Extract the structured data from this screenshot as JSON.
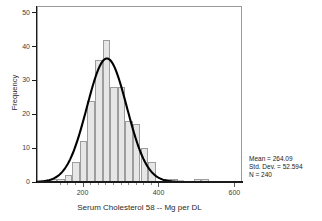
{
  "chart_data": {
    "type": "bar",
    "title": "",
    "subtitle": "",
    "xlabel": "Serum Cholesterol 58 -- Mg per DL",
    "ylabel": "Frequency",
    "xlim": [
      80,
      620
    ],
    "ylim": [
      0,
      52
    ],
    "grid": false,
    "legend_position": "none",
    "x_ticks": [
      200,
      400,
      600
    ],
    "y_ticks": [
      0,
      10,
      20,
      30,
      40,
      50
    ],
    "bin_width": 20,
    "bin_starts": [
      110,
      130,
      150,
      170,
      190,
      210,
      230,
      250,
      270,
      290,
      310,
      330,
      350,
      370,
      410,
      430,
      490,
      510
    ],
    "bin_centers": [
      120,
      140,
      160,
      180,
      200,
      220,
      240,
      260,
      280,
      300,
      320,
      340,
      360,
      380,
      420,
      440,
      500,
      520
    ],
    "values": [
      1,
      1,
      2,
      6,
      12,
      24,
      36,
      42,
      28,
      28,
      18,
      17,
      10,
      6,
      1,
      1,
      1,
      1
    ],
    "overlay": {
      "type": "normal-curve",
      "mean": 264.09,
      "std_dev": 52.594,
      "n": 240,
      "peak_frequency": 36.5
    },
    "annotations": [
      "Mean = 264.09",
      "Std. Dev. = 52.594",
      "N = 240"
    ]
  },
  "stats": {
    "mean_line": "Mean = 264.09",
    "stddev_line": "Std. Dev. = 52.594",
    "n_line": "N = 240"
  },
  "axis": {
    "y_title": "Frequency",
    "x_title": "Serum Cholesterol 58 -- Mg per DL",
    "y_tick_labels": [
      "0",
      "10",
      "20",
      "30",
      "40",
      "50"
    ],
    "x_tick_labels": [
      "200",
      "400",
      "600"
    ]
  },
  "colors": {
    "bar_fill": "#e6e6e6",
    "bar_border": "#9d9d9d",
    "curve": "#000000",
    "axis": "#1a1a1a",
    "frame": "#9a9a9a",
    "text": "#1a1a1a"
  }
}
